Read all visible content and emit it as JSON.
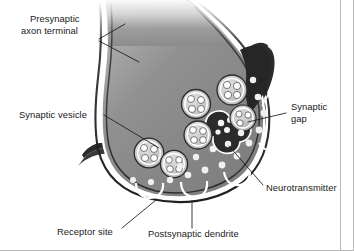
{
  "labels": {
    "presynaptic_line1": "Presynaptic",
    "presynaptic_line2": "axon terminal",
    "synaptic_vesicle": "Synaptic vesicle",
    "synaptic_gap_line1": "Synaptic",
    "synaptic_gap_line2": "gap",
    "neurotransmitter": "Neurotransmitter",
    "receptor_site": "Receptor site",
    "postsynaptic_dendrite": "Postsynaptic dendrite"
  },
  "colors": {
    "background": "#ffffff",
    "terminal_fill": "#8a8a8a",
    "terminal_fill_light": "#a8a8a8",
    "membrane_outline": "#1f1f1f",
    "membrane_inner_white": "#ffffff",
    "dendrite_dark": "#2b2b2b",
    "vesicle_ring": "#c9c9c9",
    "vesicle_core": "#ffffff",
    "neurotransmitter_dot": "#f2f2f2",
    "label_text": "#1a1a1a",
    "leader_line": "#1a1a1a",
    "frame_border": "#b9b9b9"
  },
  "parts": {
    "vesicle_count_free": 6,
    "vesicle_count_fusing": 2,
    "receptor_site_count": 3,
    "neurotransmitter_dot_count": 17
  }
}
